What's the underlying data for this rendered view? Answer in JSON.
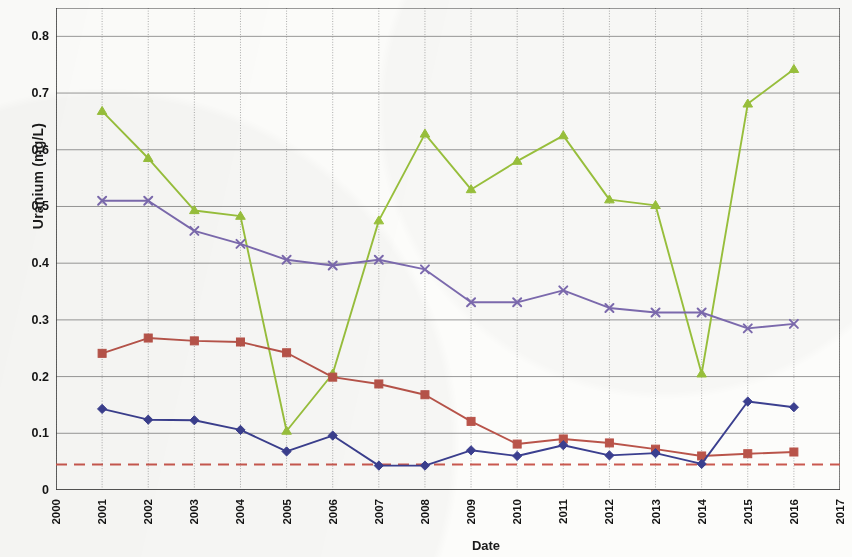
{
  "chart_data": {
    "type": "line",
    "title": "",
    "xlabel": "Date",
    "ylabel": "Uranium (mg/L)",
    "xlim": [
      2000,
      2017
    ],
    "ylim": [
      0,
      0.85
    ],
    "ytick_labels": [
      "0",
      "0.1",
      "0.2",
      "0.3",
      "0.4",
      "0.5",
      "0.6",
      "0.7",
      "0.8"
    ],
    "ytick_values": [
      0,
      0.1,
      0.2,
      0.3,
      0.4,
      0.5,
      0.6,
      0.7,
      0.8
    ],
    "xtick_labels": [
      "2000",
      "2001",
      "2002",
      "2003",
      "2004",
      "2005",
      "2006",
      "2007",
      "2008",
      "2009",
      "2010",
      "2011",
      "2012",
      "2013",
      "2014",
      "2015",
      "2016",
      "2017"
    ],
    "xtick_values": [
      2000,
      2001,
      2002,
      2003,
      2004,
      2005,
      2006,
      2007,
      2008,
      2009,
      2010,
      2011,
      2012,
      2013,
      2014,
      2015,
      2016,
      2017
    ],
    "grid": "both",
    "legend_position": "none",
    "x": [
      2001,
      2002,
      2003,
      2004,
      2005,
      2006,
      2007,
      2008,
      2009,
      2010,
      2011,
      2012,
      2013,
      2014,
      2015,
      2016
    ],
    "series": [
      {
        "name": "series-green",
        "color": "#9ac23c",
        "marker": "triangle",
        "values": [
          0.668,
          0.585,
          0.493,
          0.483,
          0.104,
          0.205,
          0.475,
          0.628,
          0.53,
          0.58,
          0.625,
          0.512,
          0.502,
          0.205,
          0.681,
          0.742
        ]
      },
      {
        "name": "series-purple",
        "color": "#7d6bb0",
        "marker": "x",
        "values": [
          0.51,
          0.51,
          0.457,
          0.434,
          0.406,
          0.396,
          0.406,
          0.389,
          0.331,
          0.331,
          0.352,
          0.321,
          0.313,
          0.313,
          0.285,
          0.293
        ]
      },
      {
        "name": "series-red",
        "color": "#b9544a",
        "marker": "square",
        "values": [
          0.241,
          0.268,
          0.263,
          0.261,
          0.242,
          0.199,
          0.187,
          0.168,
          0.121,
          0.081,
          0.09,
          0.083,
          0.072,
          0.06,
          0.064,
          0.067
        ]
      },
      {
        "name": "series-blue",
        "color": "#3b3f8f",
        "marker": "diamond",
        "values": [
          0.143,
          0.124,
          0.123,
          0.106,
          0.068,
          0.096,
          0.043,
          0.043,
          0.07,
          0.06,
          0.079,
          0.061,
          0.065,
          0.046,
          0.156,
          0.146
        ]
      }
    ],
    "reference_line": {
      "name": "standard-limit",
      "color": "#c9584f",
      "style": "dashed",
      "value": 0.045,
      "x_start": 2000,
      "x_end": 2017
    }
  },
  "colors": {
    "axis": "#3a3a3a",
    "grid": "#7d7d7d",
    "text": "#141414",
    "background": "#fcfcfa"
  }
}
